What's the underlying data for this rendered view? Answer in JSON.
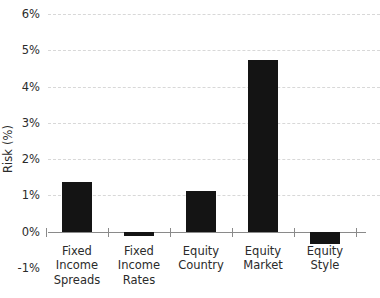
{
  "chart_data": {
    "type": "bar",
    "title": "",
    "xlabel": "",
    "ylabel": "Risk (%)",
    "categories": [
      "Fixed\nIncome\nSpreads",
      "Fixed\nIncome\nRates",
      "Equity\nCountry",
      "Equity\nMarket",
      "Equity Style"
    ],
    "values": [
      1.38,
      -0.13,
      1.12,
      4.72,
      -0.33
    ],
    "ylim": [
      -1,
      6
    ],
    "ytick_labels": [
      "6%",
      "5%",
      "4%",
      "3%",
      "2%",
      "1%",
      "0%",
      "-1%"
    ],
    "ytick_values": [
      6,
      5,
      4,
      3,
      2,
      1,
      0,
      -1
    ],
    "grid": true,
    "grid_style": "dashed-horizontal",
    "legend": "none",
    "bar_color": "#141414",
    "gridline_color": "#d8d8d8",
    "axis_color": "#8a8a8a",
    "background_color": "#ffffff"
  }
}
